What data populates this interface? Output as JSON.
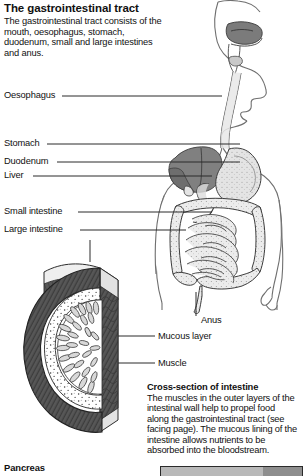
{
  "page": {
    "title": "The gastrointestinal tract",
    "intro": "The gastrointestinal tract consists of the mouth, oesophagus, stomach, duodenum, small and large intestines and anus."
  },
  "labels": {
    "oesophagus": "Oesophagus",
    "stomach": "Stomach",
    "duodenum": "Duodenum",
    "liver": "Liver",
    "small_intestine": "Small intestine",
    "large_intestine": "Large intestine",
    "anus": "Anus",
    "mucous_layer": "Mucous layer",
    "muscle": "Muscle"
  },
  "caption": {
    "heading": "Cross-section of intestine",
    "body": "The muscles in the outer layers of the intestinal wall help to propel food along the gastrointestinal tract (see facing page). The mucous lining of the intestine allows nutrients to be absorbed into the bloodstream."
  },
  "next_figure": {
    "heading": "Pancreas"
  },
  "colors": {
    "ink": "#2a2a2a",
    "text": "#111111",
    "organ_dark": "#808080",
    "organ_mid": "#9d9d9d",
    "organ_light": "#d2d2d2",
    "organ_pale": "#e9e9e9",
    "muscle_ring": "#4a4a4a",
    "lumen": "#ffffff",
    "body_outline": "#6f6f6f",
    "bar_light": "#b9b9b9",
    "bar_dark": "#8e8e8e"
  }
}
